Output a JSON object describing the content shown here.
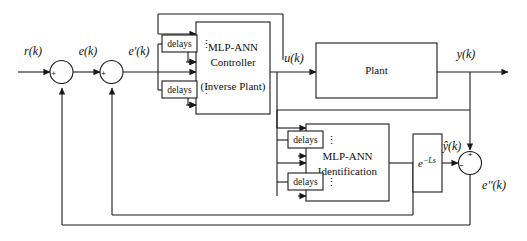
{
  "diagram": {
    "type": "block-diagram",
    "stroke_color": "#1a1a1a",
    "background": "#ffffff"
  },
  "signals": {
    "reference": "r(k)",
    "error": "e(k)",
    "error_prime": "e'(k)",
    "control": "u(k)",
    "output": "y(k)",
    "output_hat": "ŷ(k)",
    "error_double_prime": "e''(k)"
  },
  "blocks": {
    "controller": {
      "line1": "MLP-ANN",
      "line2": "Controller",
      "line3": "(Inverse Plant)"
    },
    "plant": {
      "label": "Plant"
    },
    "identification": {
      "line1": "MLP-ANN",
      "line2": "Identification"
    },
    "transport_delay": {
      "base": "e",
      "exponent": "−Ls"
    }
  },
  "delay_blocks": [
    {
      "id": "ctrl-delay-upper",
      "label": "delays"
    },
    {
      "id": "ctrl-delay-lower",
      "label": "delays"
    },
    {
      "id": "ident-delay-upper",
      "label": "delays"
    },
    {
      "id": "ident-delay-lower",
      "label": "delays"
    }
  ],
  "vertical_dots": [
    {
      "id": "dots-ctrl-upper",
      "glyph": "⋮"
    },
    {
      "id": "dots-ctrl-lower",
      "glyph": "⋮"
    },
    {
      "id": "dots-ident-upper",
      "glyph": "⋮"
    },
    {
      "id": "dots-ident-lower",
      "glyph": "⋮"
    }
  ],
  "summing_junctions": [
    {
      "id": "sum-1",
      "name": "summing-junction-reference-error",
      "plus": "+",
      "minus": "−",
      "plus_position": "left",
      "minus_position": "bottom"
    },
    {
      "id": "sum-2",
      "name": "summing-junction-error-prime",
      "plus": "+",
      "minus": "−",
      "plus_position": "left",
      "minus_position": "bottom"
    },
    {
      "id": "sum-3",
      "name": "summing-junction-identification-error",
      "plus": "+",
      "minus": "−",
      "plus_position": "top",
      "minus_position": "left"
    }
  ]
}
